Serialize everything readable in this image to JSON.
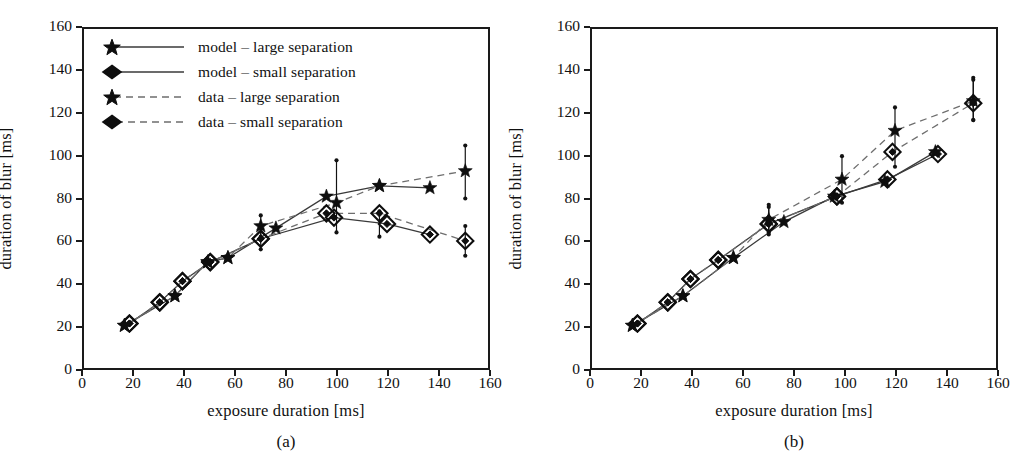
{
  "figure": {
    "panels": [
      {
        "id": "a",
        "caption": "(a)",
        "xlabel": "exposure duration [ms]",
        "ylabel": "duration of blur [ms]",
        "has_legend": true
      },
      {
        "id": "b",
        "caption": "(b)",
        "xlabel": "exposure duration [ms]",
        "ylabel": "duration of blur [ms]",
        "has_legend": false
      }
    ],
    "legend": {
      "items": [
        {
          "label": "model – large separation",
          "marker": "star",
          "line": "solid"
        },
        {
          "label": "model – small separation",
          "marker": "diamond",
          "line": "solid"
        },
        {
          "label": "data – large separation",
          "marker": "star",
          "line": "dashed"
        },
        {
          "label": "data – small separation",
          "marker": "diamond",
          "line": "dashed"
        }
      ]
    },
    "colors": {
      "ink": "#0e0e0e",
      "model_line": "#3a3a3a",
      "data_line": "#6e6e6e",
      "axis": "#1a1a1a",
      "background": "#ffffff"
    }
  },
  "chart_data": [
    {
      "type": "line",
      "panel": "a",
      "title": "(a)",
      "xlabel": "exposure duration [ms]",
      "ylabel": "duration of blur [ms]",
      "xlim": [
        0,
        160
      ],
      "ylim": [
        0,
        160
      ],
      "xticks": [
        0,
        20,
        40,
        60,
        80,
        100,
        120,
        140,
        160
      ],
      "yticks": [
        0,
        20,
        40,
        60,
        80,
        100,
        120,
        140,
        160
      ],
      "grid": false,
      "legend_position": "upper-left",
      "series": [
        {
          "name": "model – large separation",
          "marker": "star",
          "line": "solid",
          "x": [
            16,
            36,
            49,
            57,
            76,
            96,
            117,
            137
          ],
          "y": [
            20,
            34,
            50,
            52,
            66,
            81,
            86,
            85
          ]
        },
        {
          "name": "model – small separation",
          "marker": "diamond",
          "line": "solid",
          "x": [
            18,
            30,
            39,
            50,
            70,
            99,
            120,
            137
          ],
          "y": [
            21,
            31,
            41,
            50,
            61,
            71,
            68,
            63
          ]
        },
        {
          "name": "data – large separation",
          "marker": "star",
          "line": "dashed",
          "x": [
            16,
            36,
            49,
            57,
            70,
            100,
            117,
            151
          ],
          "y": [
            20,
            34,
            50,
            52,
            67,
            78,
            86,
            93
          ],
          "errors": [
            {
              "x": 70,
              "y": 67,
              "lo": 62,
              "hi": 72
            },
            {
              "x": 100,
              "y": 78,
              "lo": 64,
              "hi": 98
            },
            {
              "x": 151,
              "y": 93,
              "lo": 80,
              "hi": 105
            }
          ]
        },
        {
          "name": "data – small separation",
          "marker": "diamond",
          "line": "dashed",
          "x": [
            18,
            30,
            39,
            50,
            70,
            96,
            117,
            151
          ],
          "y": [
            21,
            31,
            41,
            50,
            61,
            73,
            73,
            60
          ],
          "errors": [
            {
              "x": 70,
              "y": 61,
              "lo": 56,
              "hi": 66
            },
            {
              "x": 117,
              "y": 73,
              "lo": 62,
              "hi": 74
            },
            {
              "x": 151,
              "y": 60,
              "lo": 53,
              "hi": 67
            }
          ]
        }
      ]
    },
    {
      "type": "line",
      "panel": "b",
      "title": "(b)",
      "xlabel": "exposure duration [ms]",
      "ylabel": "duration of blur [ms]",
      "xlim": [
        0,
        160
      ],
      "ylim": [
        0,
        160
      ],
      "xticks": [
        0,
        20,
        40,
        60,
        80,
        100,
        120,
        140,
        160
      ],
      "yticks": [
        0,
        20,
        40,
        60,
        80,
        100,
        120,
        140,
        160
      ],
      "grid": false,
      "legend_position": "none",
      "series": [
        {
          "name": "model – large separation",
          "marker": "star",
          "line": "solid",
          "x": [
            16,
            36,
            56,
            76,
            96,
            116,
            136
          ],
          "y": [
            20,
            34,
            52,
            69,
            81,
            88,
            102
          ]
        },
        {
          "name": "model – small separation",
          "marker": "diamond",
          "line": "solid",
          "x": [
            18,
            30,
            39,
            50,
            70,
            97,
            117,
            137
          ],
          "y": [
            21,
            31,
            42,
            51,
            68,
            81,
            89,
            101
          ]
        },
        {
          "name": "data – large separation",
          "marker": "star",
          "line": "dashed",
          "x": [
            16,
            36,
            56,
            70,
            99,
            120,
            151
          ],
          "y": [
            20,
            34,
            52,
            70,
            89,
            112,
            126
          ],
          "errors": [
            {
              "x": 70,
              "y": 70,
              "lo": 64,
              "hi": 77
            },
            {
              "x": 99,
              "y": 89,
              "lo": 78,
              "hi": 100
            },
            {
              "x": 120,
              "y": 112,
              "lo": 95,
              "hi": 123
            },
            {
              "x": 151,
              "y": 126,
              "lo": 117,
              "hi": 137
            }
          ]
        },
        {
          "name": "data – small separation",
          "marker": "diamond",
          "line": "dashed",
          "x": [
            18,
            30,
            39,
            50,
            70,
            97,
            119,
            151
          ],
          "y": [
            21,
            31,
            42,
            51,
            68,
            81,
            102,
            125
          ],
          "errors": [
            {
              "x": 70,
              "y": 68,
              "lo": 63,
              "hi": 76
            },
            {
              "x": 151,
              "y": 125,
              "lo": 117,
              "hi": 136
            }
          ]
        }
      ]
    }
  ]
}
